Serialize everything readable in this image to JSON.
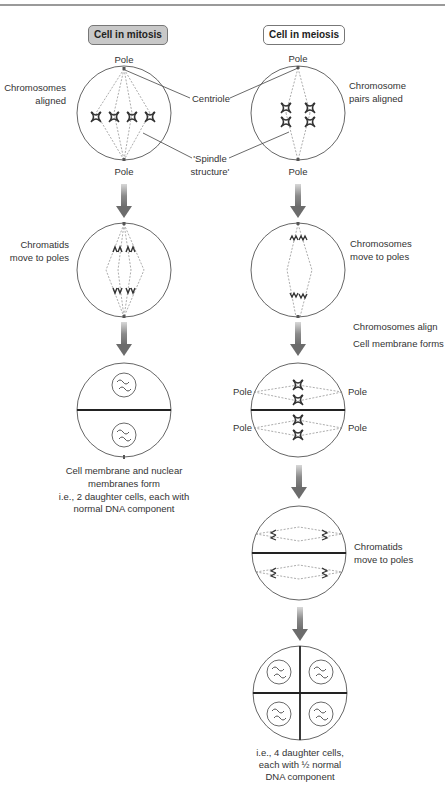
{
  "headers": {
    "mitosis": "Cell in mitosis",
    "meiosis": "Cell in meiosis"
  },
  "colors": {
    "mitosis_header_bg": "#c8c8c8",
    "meiosis_header_bg": "#ffffff",
    "arrow": "#707070",
    "spindle": "#777777",
    "line": "#444444"
  },
  "labels": {
    "pole_top_mitosis": "Pole",
    "pole_bottom_mitosis": "Pole",
    "pole_top_meiosis": "Pole",
    "pole_bottom_meiosis": "Pole",
    "chromosomes_aligned_1": "Chromosomes",
    "chromosomes_aligned_2": "aligned",
    "centriole": "Centriole",
    "spindle_1": "'Spindle",
    "spindle_2": "structure'",
    "chromosome_pairs_1": "Chromosome",
    "chromosome_pairs_2": "pairs aligned",
    "chromatids_move_1": "Chromatids",
    "chromatids_move_2": "move to poles",
    "chromosomes_move_1": "Chromosomes",
    "chromosomes_move_2": "move to poles",
    "chromosomes_align": "Chromosomes align",
    "cell_membrane_forms": "Cell membrane forms",
    "pole_left_upper": "Pole",
    "pole_right_upper": "Pole",
    "pole_left_lower": "Pole",
    "pole_right_lower": "Pole",
    "mitosis_result_1": "Cell membrane and nuclear",
    "mitosis_result_2": "membranes form",
    "mitosis_result_3": "i.e., 2 daughter cells, each with",
    "mitosis_result_4": "normal DNA component",
    "chromatids_move_meiosis_1": "Chromatids",
    "chromatids_move_meiosis_2": "move to poles",
    "meiosis_result_1": "i.e., 4 daughter cells,",
    "meiosis_result_2": "each with ½ normal",
    "meiosis_result_3": "DNA component"
  }
}
